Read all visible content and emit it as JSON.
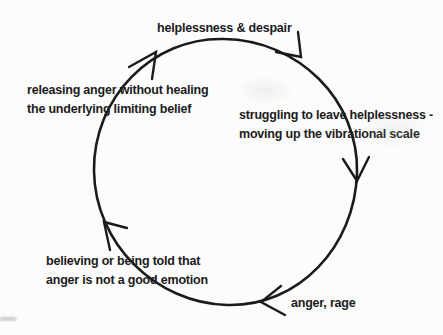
{
  "diagram": {
    "type": "cycle",
    "direction": "clockwise",
    "labels": {
      "top": "helplessness & despair",
      "left": [
        "releasing anger without healing",
        "the underlying limiting belief"
      ],
      "right": [
        "struggling to leave helplessness -",
        "moving up the vibrational scale"
      ],
      "bottom_left": [
        "believing or being told that",
        "anger is not a good emotion"
      ],
      "bottom_right": "anger, rage"
    },
    "cycle_stages": [
      "helplessness & despair",
      "struggling to leave helplessness - moving up the vibrational scale",
      "anger, rage",
      "believing or being told that anger is not a good emotion",
      "releasing anger without healing the underlying limiting belief"
    ],
    "colors": {
      "ink": "#1b1b1b",
      "background": "#fcfcfc"
    }
  }
}
